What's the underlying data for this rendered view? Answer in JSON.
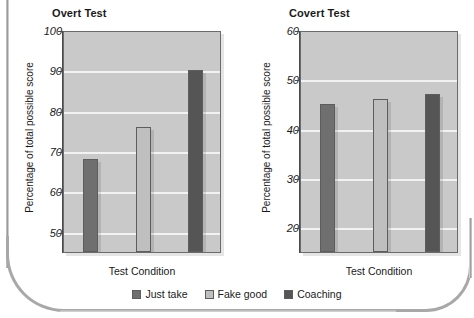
{
  "colors": {
    "just_take": "#6f6f6f",
    "fake_good": "#bfbfbf",
    "coaching": "#555555",
    "plot_background": "#c9c9c9",
    "gridline": "#f2f2f2",
    "axis": "#4a4a4a"
  },
  "legend": {
    "items": [
      {
        "label": "Just take",
        "color": "#6f6f6f"
      },
      {
        "label": "Fake good",
        "color": "#bfbfbf"
      },
      {
        "label": "Coaching",
        "color": "#555555"
      }
    ]
  },
  "chart_data": [
    {
      "type": "bar",
      "title": "Overt Test",
      "xlabel": "Test Condition",
      "ylabel": "Percentage of total possible score",
      "categories": [
        "Just take",
        "Fake good",
        "Coaching"
      ],
      "values": [
        68,
        76,
        90
      ],
      "ylim": [
        45,
        100
      ],
      "yticks": [
        50,
        60,
        70,
        80,
        90,
        100
      ],
      "grid": true,
      "legend_position": "bottom",
      "series": [
        {
          "name": "Just take",
          "values": [
            68
          ],
          "color": "#6f6f6f"
        },
        {
          "name": "Fake good",
          "values": [
            76
          ],
          "color": "#bfbfbf"
        },
        {
          "name": "Coaching",
          "values": [
            90
          ],
          "color": "#555555"
        }
      ]
    },
    {
      "type": "bar",
      "title": "Covert Test",
      "xlabel": "Test  Condition",
      "ylabel": "Percentage of total possible score",
      "categories": [
        "Just take",
        "Fake good",
        "Coaching"
      ],
      "values": [
        45,
        46,
        47
      ],
      "ylim": [
        15,
        60
      ],
      "yticks": [
        20,
        30,
        40,
        50,
        60
      ],
      "grid": true,
      "legend_position": "bottom",
      "series": [
        {
          "name": "Just take",
          "values": [
            45
          ],
          "color": "#6f6f6f"
        },
        {
          "name": "Fake good",
          "values": [
            46
          ],
          "color": "#bfbfbf"
        },
        {
          "name": "Coaching",
          "values": [
            47
          ],
          "color": "#555555"
        }
      ]
    }
  ]
}
